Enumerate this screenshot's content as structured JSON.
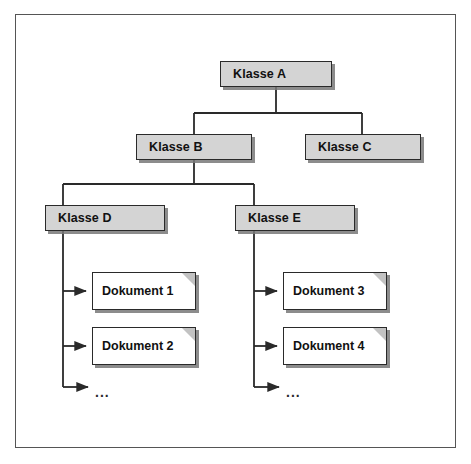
{
  "diagram": {
    "type": "tree",
    "border_color": "#555555",
    "node_fill": "#d4d4d4",
    "node_border": "#2a2a2a",
    "doc_fill": "#ffffff",
    "fold_color": "#c2c2c2",
    "line_color": "#2a2a2a"
  },
  "nodes": {
    "klasse_a": {
      "label": "Klasse A",
      "x": 220,
      "y": 61,
      "w": 112,
      "h": 26
    },
    "klasse_b": {
      "label": "Klasse B",
      "x": 136,
      "y": 134,
      "w": 116,
      "h": 26
    },
    "klasse_c": {
      "label": "Klasse C",
      "x": 305,
      "y": 134,
      "w": 116,
      "h": 26
    },
    "klasse_d": {
      "label": "Klasse D",
      "x": 45,
      "y": 205,
      "w": 120,
      "h": 26
    },
    "klasse_e": {
      "label": "Klasse E",
      "x": 235,
      "y": 205,
      "w": 120,
      "h": 26
    }
  },
  "documents": {
    "dokument_1": {
      "label": "Dokument 1",
      "x": 92,
      "y": 272,
      "w": 104,
      "h": 38
    },
    "dokument_2": {
      "label": "Dokument 2",
      "x": 92,
      "y": 327,
      "w": 104,
      "h": 38
    },
    "dokument_3": {
      "label": "Dokument 3",
      "x": 283,
      "y": 272,
      "w": 104,
      "h": 38
    },
    "dokument_4": {
      "label": "Dokument 4",
      "x": 283,
      "y": 327,
      "w": 104,
      "h": 38
    }
  },
  "ellipses": {
    "left": {
      "label": "...",
      "x": 95,
      "y": 385
    },
    "right": {
      "label": "...",
      "x": 286,
      "y": 385
    }
  },
  "edges": [
    {
      "from": "klasse_a",
      "to": "klasse_b",
      "style": "orthogonal"
    },
    {
      "from": "klasse_a",
      "to": "klasse_c",
      "style": "orthogonal"
    },
    {
      "from": "klasse_b",
      "to": "klasse_d",
      "style": "orthogonal"
    },
    {
      "from": "klasse_b",
      "to": "klasse_e",
      "style": "orthogonal"
    },
    {
      "from": "klasse_d",
      "to": "dokument_1",
      "style": "arrow"
    },
    {
      "from": "klasse_d",
      "to": "dokument_2",
      "style": "arrow"
    },
    {
      "from": "klasse_d",
      "to": "ellipsis_left",
      "style": "arrow"
    },
    {
      "from": "klasse_e",
      "to": "dokument_3",
      "style": "arrow"
    },
    {
      "from": "klasse_e",
      "to": "dokument_4",
      "style": "arrow"
    },
    {
      "from": "klasse_e",
      "to": "ellipsis_right",
      "style": "arrow"
    }
  ]
}
